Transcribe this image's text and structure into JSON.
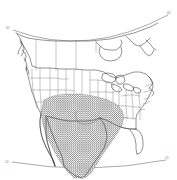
{
  "figure": {
    "type": "map",
    "projection": "lambert-conformal-conic",
    "region": "North America (United States, southern Canada, northern Mexico)",
    "background_color": "#ffffff",
    "outline_color": "#3a3a3a",
    "state_border_color": "#6e6e6e",
    "graticule_color": "#555555",
    "label_color": "#8a8a8a"
  },
  "graticules": {
    "top_parallel": {
      "name": "upper-latitude-arc",
      "left_label": "60",
      "right_label": "60"
    },
    "bottom_parallel": {
      "name": "lower-latitude-arc",
      "left_label": "20",
      "right_label": "20"
    }
  },
  "labels": {
    "top_left": "60",
    "top_right": "60",
    "bottom_left": "20",
    "bottom_right": "20"
  },
  "shaded_region": {
    "name": "hatched-study-area",
    "pattern": "cross-hatch",
    "description": "Dense cross-hatched shading over Texas, the southern Great Plains, northern and central Mexico, extending to the Gulf coast",
    "fill_color": "#2e2e2e",
    "coverage_note": "south-central North America"
  },
  "features": [
    {
      "name": "united-states-outline"
    },
    {
      "name": "canada-outline"
    },
    {
      "name": "mexico-outline"
    },
    {
      "name": "hudson-bay"
    },
    {
      "name": "great-lakes"
    },
    {
      "name": "baja-california-peninsula"
    },
    {
      "name": "gulf-of-california"
    },
    {
      "name": "florida-peninsula"
    },
    {
      "name": "pacific-northwest-islands"
    },
    {
      "name": "us-state-boundaries"
    }
  ]
}
